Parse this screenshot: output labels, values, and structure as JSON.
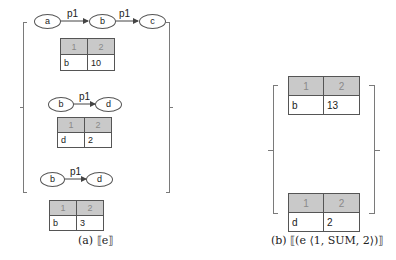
{
  "panel_a": {
    "caption": "(a)  ⟦e⟧",
    "graphs": [
      {
        "nodes": [
          "a",
          "b",
          "c"
        ],
        "edges": [
          {
            "from": "a",
            "to": "b",
            "label": "p1"
          },
          {
            "from": "b",
            "to": "c",
            "label": "p1"
          }
        ],
        "table": {
          "headers": [
            "1",
            "2"
          ],
          "rows": [
            [
              "b",
              "10"
            ]
          ]
        }
      },
      {
        "nodes": [
          "b",
          "d"
        ],
        "edges": [
          {
            "from": "b",
            "to": "d",
            "label": "p1"
          }
        ],
        "table": {
          "headers": [
            "1",
            "2"
          ],
          "rows": [
            [
              "d",
              "2"
            ]
          ]
        }
      },
      {
        "nodes": [
          "b",
          "d"
        ],
        "edges": [
          {
            "from": "b",
            "to": "d",
            "label": "p1"
          }
        ],
        "table": {
          "headers": [
            "1",
            "2"
          ],
          "rows": [
            [
              "b",
              "3"
            ]
          ]
        }
      }
    ]
  },
  "panel_b": {
    "caption": "(b)  ⟦(e ⟨1, SUM, 2⟩)⟧",
    "tables": [
      {
        "headers": [
          "1",
          "2"
        ],
        "rows": [
          [
            "b",
            "13"
          ]
        ]
      },
      {
        "headers": [
          "1",
          "2"
        ],
        "rows": [
          [
            "d",
            "2"
          ]
        ]
      }
    ]
  },
  "colors": {
    "header_bg": "#c9c9c9",
    "header_text": "#8a8a8a",
    "border": "#555555",
    "bracket": "#7a7a7a"
  }
}
